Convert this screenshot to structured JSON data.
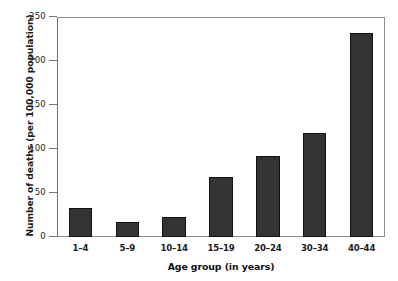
{
  "chart_data": {
    "type": "bar",
    "title": "",
    "xlabel": "Age group (in years)",
    "ylabel": "Number of deaths (per 100,000 population)",
    "categories": [
      "1–4",
      "5–9",
      "10–14",
      "15–19",
      "20–24",
      "30–34",
      "40–44"
    ],
    "values": [
      33,
      17,
      23,
      68,
      92,
      118,
      232
    ],
    "ylim": [
      0,
      250
    ],
    "yticks": [
      0,
      50,
      100,
      150,
      200,
      250
    ],
    "ytick_labels": [
      "0",
      "50",
      "100",
      "150",
      "200",
      "250"
    ],
    "grid": false,
    "legend": "none",
    "bar_color": "#333333",
    "axis_color": "#8a8a8a"
  }
}
